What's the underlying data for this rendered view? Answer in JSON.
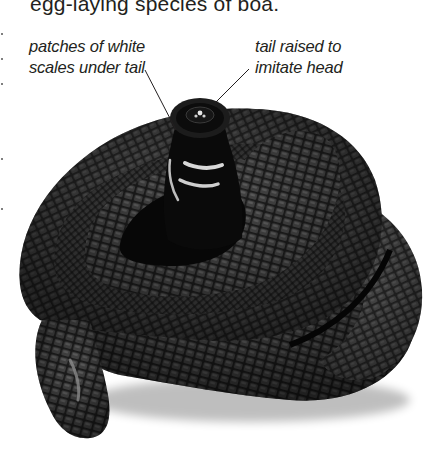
{
  "page": {
    "intro_text": "egg-laying species of boa.",
    "photo_subject": "coiled black snake with tail raised",
    "annotations": [
      {
        "id": "white-scales",
        "lines": [
          "patches of white",
          "scales under tail"
        ]
      },
      {
        "id": "tail-raised",
        "lines": [
          "tail raised to",
          "imitate head"
        ]
      }
    ]
  },
  "colors": {
    "background": "#ffffff",
    "text": "#231f20",
    "snake_dark": "#0e0e0e",
    "snake_mid": "#3a3a3a",
    "snake_light": "#6a6a6a",
    "leader_line": "#231f20"
  }
}
